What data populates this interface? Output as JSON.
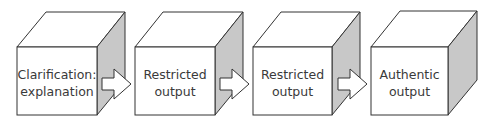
{
  "diagram": {
    "type": "process-flow",
    "colors": {
      "face_front": "#ffffff",
      "face_top": "#ffffff",
      "face_side": "#c8c8c8",
      "stroke": "#333333",
      "text": "#3a3a3a"
    },
    "steps": [
      {
        "line1": "Clarification:",
        "line2": "explanation"
      },
      {
        "line1": "Restricted",
        "line2": "output"
      },
      {
        "line1": "Restricted",
        "line2": "output"
      },
      {
        "line1": "Authentic",
        "line2": "output"
      }
    ],
    "connectors": [
      {
        "from": 0,
        "to": 1,
        "shape": "block-arrow-right"
      },
      {
        "from": 1,
        "to": 2,
        "shape": "block-arrow-right"
      },
      {
        "from": 2,
        "to": 3,
        "shape": "block-arrow-right"
      }
    ]
  }
}
